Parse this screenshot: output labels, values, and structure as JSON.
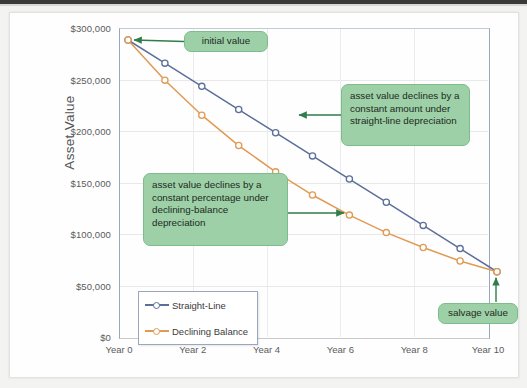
{
  "chart_data": {
    "type": "line",
    "title": "",
    "xlabel": "",
    "ylabel": "Asset Value",
    "x": [
      0,
      1,
      2,
      3,
      4,
      5,
      6,
      7,
      8,
      9,
      10
    ],
    "x_tick_labels": [
      "Year 0",
      "Year 2",
      "Year 4",
      "Year 6",
      "Year 8",
      "Year 10"
    ],
    "x_tick_values": [
      0,
      2,
      4,
      6,
      8,
      10
    ],
    "y_tick_labels": [
      "$300,000",
      "$250,000",
      "$200,000",
      "$150,000",
      "$100,000",
      "$50,000",
      "$0"
    ],
    "y_tick_values": [
      300000,
      250000,
      200000,
      150000,
      100000,
      50000,
      0
    ],
    "ylim": [
      0,
      300000
    ],
    "xlim": [
      0,
      10
    ],
    "grid": true,
    "legend_position": "lower-left-inside",
    "series": [
      {
        "name": "Straight-Line",
        "color": "#5b6f9a",
        "marker": "circle-open",
        "values": [
          300000,
          277500,
          255000,
          232500,
          210000,
          187500,
          165000,
          142500,
          120000,
          97500,
          75000
        ]
      },
      {
        "name": "Declining Balance",
        "color": "#e09a54",
        "marker": "circle-open",
        "values": [
          300000,
          261000,
          227000,
          197500,
          172000,
          149500,
          130000,
          113000,
          98500,
          85500,
          75000
        ]
      }
    ],
    "annotations": [
      {
        "id": "initial-value",
        "text": "initial value",
        "points_to": "Year 0, $300,000",
        "arrow_direction": "left"
      },
      {
        "id": "straight-line-note",
        "text": "asset value declines by a constant amount under straight-line depreciation",
        "points_to": "Straight-Line series",
        "arrow_direction": "left"
      },
      {
        "id": "declining-balance-note",
        "text": "asset value declines by a constant percentage under declining-balance depreciation",
        "points_to": "Declining Balance series",
        "arrow_direction": "right"
      },
      {
        "id": "salvage-value",
        "text": "salvage value",
        "points_to": "Year 10, $75,000",
        "arrow_direction": "up"
      }
    ],
    "annotation_color": "#9ed0a8",
    "annotation_border_color": "#7cbd8b",
    "arrow_color": "#2e7d4a"
  },
  "legend": {
    "items": [
      {
        "label": "Straight-Line",
        "color": "#5b6f9a"
      },
      {
        "label": "Declining Balance",
        "color": "#e09a54"
      }
    ]
  },
  "axes": {
    "y_title": "Asset Value"
  }
}
